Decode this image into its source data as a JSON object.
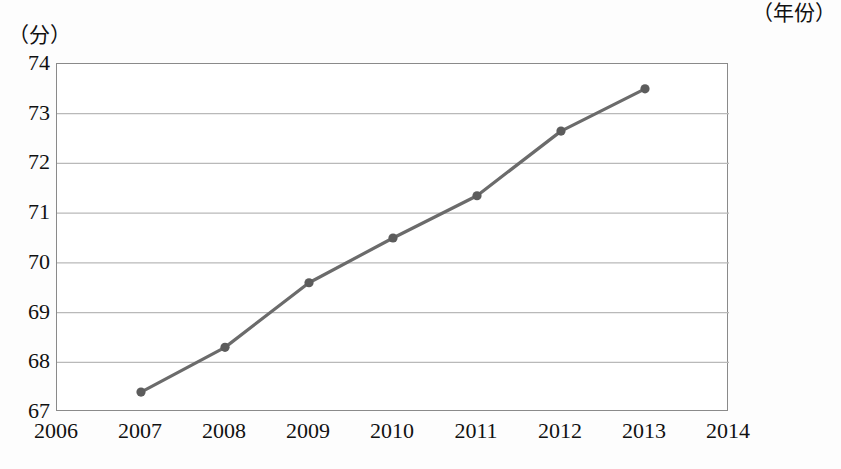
{
  "chart_data": {
    "type": "line",
    "title": "",
    "xlabel": "（年份）",
    "ylabel": "（分）",
    "x": [
      2007,
      2008,
      2009,
      2010,
      2011,
      2012,
      2013
    ],
    "values": [
      67.4,
      68.3,
      69.6,
      70.5,
      71.35,
      72.65,
      73.5
    ],
    "series": [
      {
        "name": "",
        "values": [
          67.4,
          68.3,
          69.6,
          70.5,
          71.35,
          72.65,
          73.5
        ]
      }
    ],
    "x_ticks": [
      2006,
      2007,
      2008,
      2009,
      2010,
      2011,
      2012,
      2013,
      2014
    ],
    "x_tick_labels": [
      "2006",
      "2007",
      "2008",
      "2009",
      "2010",
      "2011",
      "2012",
      "2013",
      "2014"
    ],
    "y_ticks": [
      67,
      68,
      69,
      70,
      71,
      72,
      73,
      74
    ],
    "y_tick_labels": [
      "67",
      "68",
      "69",
      "70",
      "71",
      "72",
      "73",
      "74"
    ],
    "xlim": [
      2006,
      2014
    ],
    "ylim": [
      67,
      74
    ],
    "grid": true,
    "grid_axis": "y",
    "legend": "none",
    "line_color": "#6b6b6b",
    "marker_color": "#5c5c5c",
    "grid_color": "#b9b9b9",
    "axis_color": "#8a8a8a",
    "marker": "circle"
  }
}
